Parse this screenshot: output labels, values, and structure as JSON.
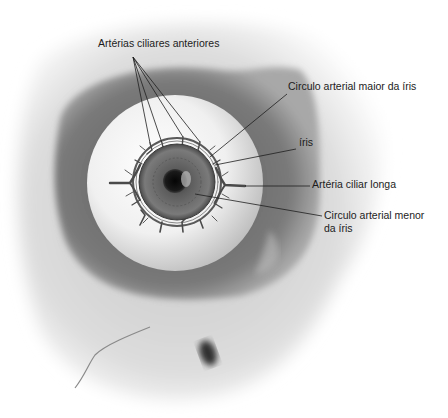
{
  "figure": {
    "colors": {
      "background": "#ffffff",
      "skull": "#d9d9d9",
      "orbit_shadow": "#6e6e6e",
      "sclera": "#f2f2f2",
      "iris": "#6a6a6a",
      "pupil": "#121212",
      "leader_line": "#1e1e1e",
      "vessel": "#4a4a4a"
    }
  },
  "labels": {
    "anterior_ciliary_arteries": "Artérias ciliares anteriores",
    "major_arterial_circle": "Circulo arterial maior da íris",
    "iris": "íris",
    "long_ciliary_artery": "Artéria ciliar longa",
    "minor_arterial_circle_line1": "Circulo arterial menor",
    "minor_arterial_circle_line2": "da íris"
  }
}
